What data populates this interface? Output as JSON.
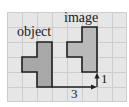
{
  "diagram": {
    "grid": {
      "origin_x": 7,
      "origin_y": 12,
      "cell_size": 15,
      "columns": 8,
      "rows": 6,
      "background_color": "#e6e6e6",
      "line_color": "#cdcdcd"
    },
    "object": {
      "label": "object",
      "fill_color": "#a8a8a8",
      "outline_color": "#1e1e1e",
      "cells": "plus-like shape: 3-cell vertical bar with 1-cell arm to the left of middle"
    },
    "image": {
      "label": "image",
      "fill_color": "#b9b9b9",
      "outline_color": "#1e1e1e"
    },
    "translation": {
      "horizontal_label": "3",
      "vertical_label": "1",
      "arrow_color": "#1e1e1e"
    }
  }
}
